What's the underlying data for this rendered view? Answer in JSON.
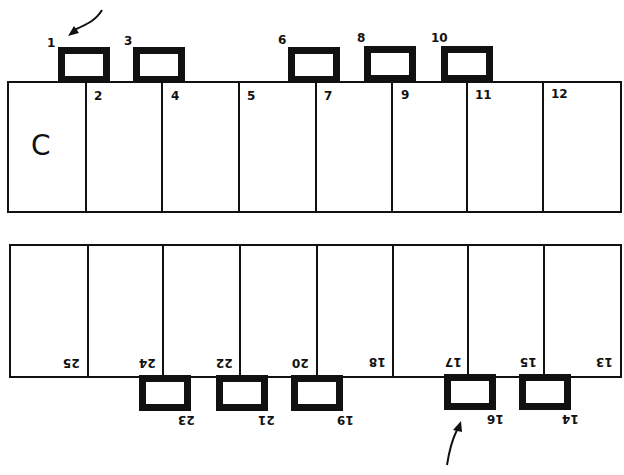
{
  "diagram": {
    "type": "numbered block layout (two rows of rectangles with tabs)",
    "stroke_color": "#111111",
    "background": "#ffffff",
    "top_row": {
      "corner_label": "C",
      "cells": [
        {
          "label": ""
        },
        {
          "label": "2"
        },
        {
          "label": "4"
        },
        {
          "label": "5"
        },
        {
          "label": "7"
        },
        {
          "label": "9"
        },
        {
          "label": "11"
        },
        {
          "label": "12"
        }
      ],
      "tabs": [
        {
          "label": "1"
        },
        {
          "label": "3"
        },
        {
          "label": "6"
        },
        {
          "label": "8"
        },
        {
          "label": "10"
        }
      ],
      "arrow_points_to": "1"
    },
    "bottom_row": {
      "orientation": "rotated 180°",
      "cells": [
        {
          "label": "25"
        },
        {
          "label": "24"
        },
        {
          "label": "22"
        },
        {
          "label": "20"
        },
        {
          "label": "18"
        },
        {
          "label": "17"
        },
        {
          "label": "15"
        },
        {
          "label": "13"
        }
      ],
      "tabs": [
        {
          "label": "23"
        },
        {
          "label": "21"
        },
        {
          "label": "19"
        },
        {
          "label": "16"
        },
        {
          "label": "14"
        }
      ],
      "arrow_points_to": "16"
    }
  }
}
